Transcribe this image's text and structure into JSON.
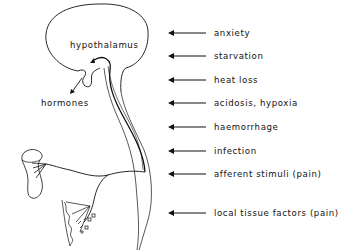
{
  "diagram": {
    "labels": {
      "hypothalamus": "hypothalamus",
      "hormones": "hormones"
    },
    "stimuli": [
      {
        "label": "anxiety",
        "y": 28
      },
      {
        "label": "starvation",
        "y": 51
      },
      {
        "label": "heat loss",
        "y": 75
      },
      {
        "label": "acidosis, hypoxia",
        "y": 98
      },
      {
        "label": "haemorrhage",
        "y": 122
      },
      {
        "label": "infection",
        "y": 146
      },
      {
        "label": "afferent stimuli (pain)",
        "y": 169
      },
      {
        "label": "local tissue factors (pain)",
        "y": 208
      }
    ],
    "colors": {
      "line": "#111111",
      "background": "#ffffff"
    }
  }
}
